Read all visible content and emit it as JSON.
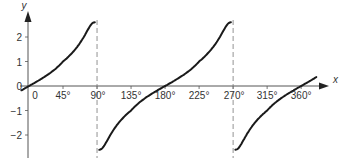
{
  "chart_data": {
    "type": "line",
    "title": "",
    "function": "y = tan x",
    "xlabel": "x",
    "ylabel": "y",
    "xlim": [
      -8,
      385
    ],
    "ylim": [
      -2.6,
      2.6
    ],
    "x_ticks": [
      {
        "value": 0,
        "label": "0"
      },
      {
        "value": 45,
        "label": "45°"
      },
      {
        "value": 90,
        "label": "90°"
      },
      {
        "value": 135,
        "label": "135°"
      },
      {
        "value": 180,
        "label": "180°"
      },
      {
        "value": 225,
        "label": "225°"
      },
      {
        "value": 270,
        "label": "270°"
      },
      {
        "value": 315,
        "label": "315°"
      },
      {
        "value": 360,
        "label": "360°"
      }
    ],
    "y_ticks": [
      {
        "value": 2,
        "label": "2"
      },
      {
        "value": 1,
        "label": "1"
      },
      {
        "value": -1,
        "label": "−1"
      },
      {
        "value": -2,
        "label": "−2"
      }
    ],
    "origin_label": "0",
    "asymptotes": [
      90,
      270
    ],
    "series": [
      {
        "name": "tan x branch 1",
        "x_range": [
          -10,
          87
        ]
      },
      {
        "name": "tan x branch 2",
        "x_range": [
          93,
          267
        ]
      },
      {
        "name": "tan x branch 3",
        "x_range": [
          273,
          380
        ]
      }
    ],
    "grid": false,
    "legend": "none"
  }
}
